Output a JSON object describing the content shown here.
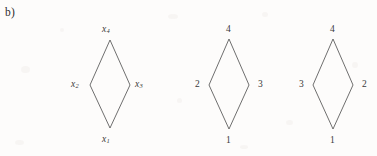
{
  "figure": {
    "panel_label": "b)",
    "background_color": "#fdfcfb",
    "stroke_color": "#555555",
    "text_color": "#3a3a3a"
  },
  "diagrams": [
    {
      "id": "diagram-variables",
      "style": "italic",
      "vertices": {
        "top": {
          "base": "x",
          "sub": "4"
        },
        "left": {
          "base": "x",
          "sub": "2"
        },
        "right": {
          "base": "x",
          "sub": "3"
        },
        "bottom": {
          "base": "x",
          "sub": "1"
        }
      }
    },
    {
      "id": "diagram-ordering-a",
      "style": "plain",
      "vertices": {
        "top": {
          "base": "4",
          "sub": ""
        },
        "left": {
          "base": "2",
          "sub": ""
        },
        "right": {
          "base": "3",
          "sub": ""
        },
        "bottom": {
          "base": "1",
          "sub": ""
        }
      }
    },
    {
      "id": "diagram-ordering-b",
      "style": "plain",
      "vertices": {
        "top": {
          "base": "4",
          "sub": ""
        },
        "left": {
          "base": "3",
          "sub": ""
        },
        "right": {
          "base": "2",
          "sub": ""
        },
        "bottom": {
          "base": "1",
          "sub": ""
        }
      }
    }
  ]
}
